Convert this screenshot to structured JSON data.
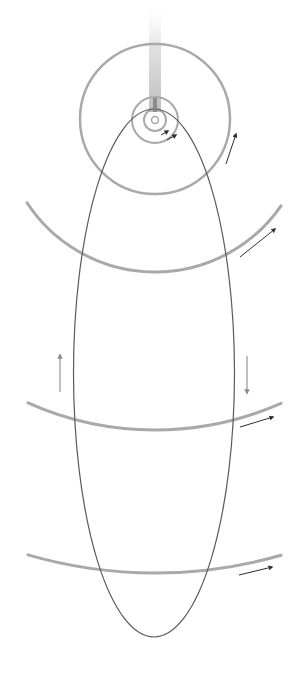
{
  "diagram": {
    "title": "",
    "colors": {
      "background": "#ffffff",
      "planet_orbit": "#a9a9a9",
      "comet_orbit": "#5a5a5a",
      "arrow_dark": "#2e2e2e",
      "arrow_light": "#8a8a8a",
      "tail": "#c8c8c8",
      "tail_dark": "#8c8c8c"
    },
    "sun": {
      "cx": 155,
      "cy": 120,
      "r": 3.5
    },
    "inner_orbits": [
      {
        "r": 11
      },
      {
        "r": 23
      }
    ],
    "outer_circle": {
      "cx": 155,
      "cy": 119,
      "r": 75
    },
    "orbit_arcs": [
      {
        "name": "orbit-arc-1",
        "r": 153,
        "x1": 27,
        "x2": 281
      },
      {
        "name": "orbit-arc-2",
        "r": 311,
        "x1": 28,
        "x2": 281
      },
      {
        "name": "orbit-arc-3",
        "r": 454,
        "x1": 28,
        "x2": 281
      }
    ],
    "comet_orbit": {
      "cx": 154,
      "cy": 373,
      "rx": 80.5,
      "ry": 264
    },
    "tail": {
      "x": 149,
      "y_top": 0,
      "width": 12,
      "height": 112
    },
    "arrows": [
      {
        "name": "inner-orbit-arrow-1",
        "from": [
          161,
          135
        ],
        "to": [
          168,
          131
        ],
        "style": "dark"
      },
      {
        "name": "inner-orbit-arrow-2",
        "from": [
          167,
          140
        ],
        "to": [
          176,
          135
        ],
        "style": "dark"
      },
      {
        "name": "outer-circle-arrow",
        "from": [
          226,
          164
        ],
        "to": [
          236,
          134
        ],
        "style": "dark"
      },
      {
        "name": "arc-1-arrow",
        "from": [
          240,
          257
        ],
        "to": [
          275,
          229
        ],
        "style": "dark"
      },
      {
        "name": "arc-2-arrow",
        "from": [
          240,
          427
        ],
        "to": [
          273,
          417
        ],
        "style": "dark"
      },
      {
        "name": "arc-3-arrow",
        "from": [
          239,
          575
        ],
        "to": [
          272,
          567
        ],
        "style": "dark"
      },
      {
        "name": "comet-inbound-arrow",
        "from": [
          60,
          392
        ],
        "to": [
          60,
          355
        ],
        "style": "light"
      },
      {
        "name": "comet-outbound-arrow",
        "from": [
          247,
          356
        ],
        "to": [
          247,
          393
        ],
        "style": "light"
      }
    ]
  }
}
